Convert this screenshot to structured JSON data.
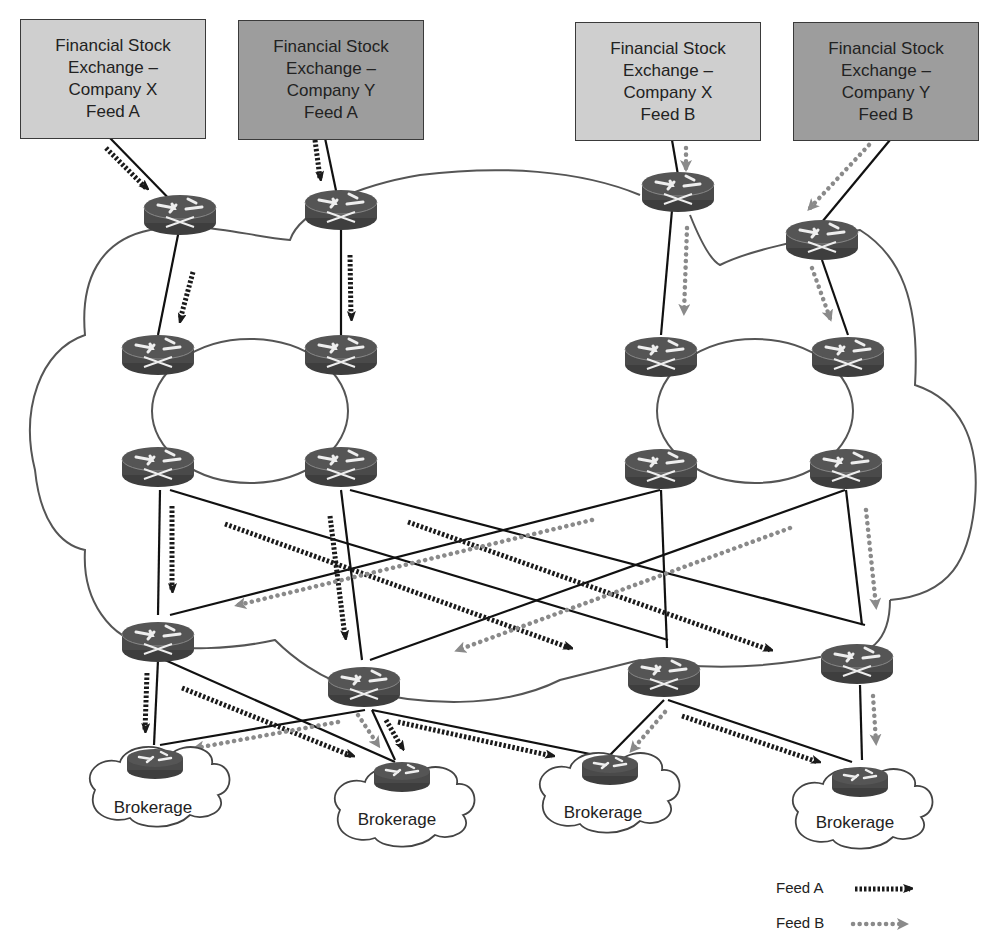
{
  "diagram": {
    "sources": [
      {
        "id": "src-x-a",
        "lines": [
          "Financial Stock",
          "Exchange –",
          "Company X",
          "Feed A"
        ],
        "shade": "light"
      },
      {
        "id": "src-y-a",
        "lines": [
          "Financial Stock",
          "Exchange –",
          "Company Y",
          "Feed A"
        ],
        "shade": "dark"
      },
      {
        "id": "src-x-b",
        "lines": [
          "Financial Stock",
          "Exchange –",
          "Company X",
          "Feed B"
        ],
        "shade": "light"
      },
      {
        "id": "src-y-b",
        "lines": [
          "Financial Stock",
          "Exchange –",
          "Company Y",
          "Feed B"
        ],
        "shade": "dark"
      }
    ],
    "brokerages": [
      {
        "label": "Brokerage"
      },
      {
        "label": "Brokerage"
      },
      {
        "label": "Brokerage"
      },
      {
        "label": "Brokerage"
      }
    ],
    "legend": [
      {
        "label": "Feed A",
        "style": "black-dashed-arrow"
      },
      {
        "label": "Feed B",
        "style": "gray-dotted-arrow"
      }
    ],
    "colors": {
      "feed_a": "#1a1a1a",
      "feed_b": "#8a8a8a",
      "router": "#4a4a4a",
      "box_light": "#cfcfcf",
      "box_dark": "#9d9d9d"
    }
  }
}
